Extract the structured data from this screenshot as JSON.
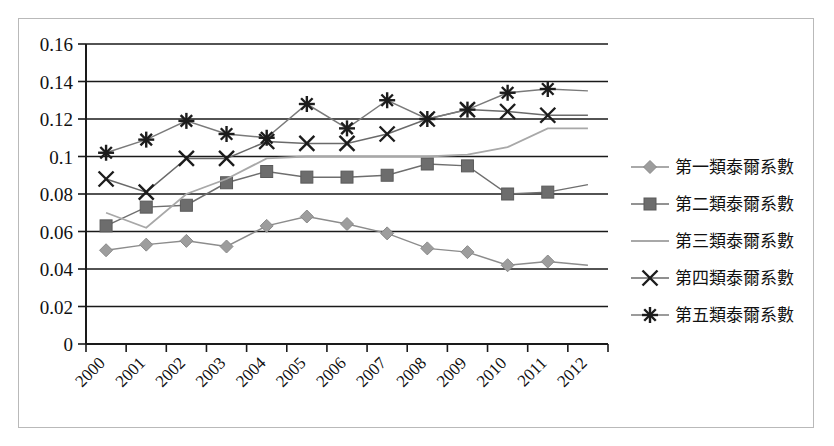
{
  "chart_data": {
    "type": "line",
    "title": "",
    "xlabel": "",
    "ylabel": "",
    "x": [
      2000,
      2001,
      2002,
      2003,
      2004,
      2005,
      2006,
      2007,
      2008,
      2009,
      2010,
      2011,
      2012
    ],
    "xtick_labels": [
      "2000",
      "2001",
      "2002",
      "2003",
      "2004",
      "2005",
      "2006",
      "2007",
      "2008",
      "2009",
      "2010",
      "2011",
      "2012"
    ],
    "ytick_labels": [
      "0",
      "0.02",
      "0.04",
      "0.06",
      "0.08",
      "0.1",
      "0.12",
      "0.14",
      "0.16"
    ],
    "ytick_values": [
      0,
      0.02,
      0.04,
      0.06,
      0.08,
      0.1,
      0.12,
      0.14,
      0.16
    ],
    "ylim": [
      0,
      0.16
    ],
    "grid": "horizontal",
    "legend_position": "right",
    "series": [
      {
        "name": "第一類泰爾系數",
        "marker": "diamond",
        "color": "#9d9d9d",
        "values": [
          0.05,
          0.053,
          0.055,
          0.052,
          0.063,
          0.068,
          0.064,
          0.059,
          0.051,
          0.049,
          0.042,
          0.044,
          0.042
        ]
      },
      {
        "name": "第二類泰爾系數",
        "marker": "square",
        "color": "#6d6d6d",
        "values": [
          0.063,
          0.073,
          0.074,
          0.086,
          0.092,
          0.089,
          0.089,
          0.09,
          0.096,
          0.095,
          0.08,
          0.081,
          0.085
        ]
      },
      {
        "name": "第三類泰爾系數",
        "marker": "none",
        "color": "#a8a8a8",
        "values": [
          0.07,
          0.062,
          0.08,
          0.088,
          0.099,
          0.1,
          0.1,
          0.1,
          0.1,
          0.101,
          0.105,
          0.115,
          0.115
        ]
      },
      {
        "name": "第四類泰爾系數",
        "marker": "x",
        "color": "#6a6a6a",
        "values": [
          0.088,
          0.081,
          0.099,
          0.099,
          0.108,
          0.107,
          0.107,
          0.112,
          0.12,
          0.125,
          0.124,
          0.122,
          0.122
        ]
      },
      {
        "name": "第五類泰爾系數",
        "marker": "star",
        "color": "#7a7a7a",
        "values": [
          0.102,
          0.109,
          0.119,
          0.112,
          0.11,
          0.128,
          0.115,
          0.13,
          0.12,
          0.125,
          0.134,
          0.136,
          0.135
        ]
      }
    ]
  },
  "legend": {
    "items": [
      {
        "label": "第一類泰爾系數",
        "marker": "diamond"
      },
      {
        "label": "第二類泰爾系數",
        "marker": "square"
      },
      {
        "label": "第三類泰爾系數",
        "marker": "none"
      },
      {
        "label": "第四類泰爾系數",
        "marker": "x"
      },
      {
        "label": "第五類泰爾系數",
        "marker": "star"
      }
    ]
  }
}
